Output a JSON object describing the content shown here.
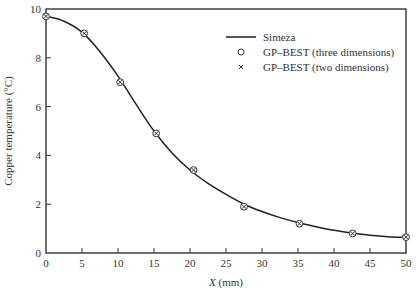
{
  "chart_data": {
    "type": "line",
    "title": "",
    "xlabel": "X (mm)",
    "xlabel_italic_part": "X",
    "xlabel_rest": " (mm)",
    "ylabel": "Copper temperature (°C)",
    "xlim": [
      0,
      50
    ],
    "ylim": [
      0,
      10
    ],
    "xticks": [
      0,
      5,
      10,
      15,
      20,
      25,
      30,
      35,
      40,
      45,
      50
    ],
    "yticks": [
      0,
      2,
      4,
      6,
      8,
      10
    ],
    "grid": false,
    "legend_position": "upper right",
    "series": [
      {
        "name": "Simeza",
        "style": "solid-line",
        "color": "#222222",
        "x": [
          0,
          2.5,
          5,
          7.5,
          10,
          12.5,
          15,
          17.5,
          20,
          22.5,
          25,
          27.5,
          30,
          32.5,
          35,
          37.5,
          40,
          42.5,
          45,
          47.5,
          50
        ],
        "y": [
          9.7,
          9.5,
          9.05,
          8.25,
          7.25,
          6.1,
          5.0,
          4.1,
          3.4,
          2.85,
          2.4,
          2.0,
          1.7,
          1.45,
          1.25,
          1.08,
          0.93,
          0.82,
          0.73,
          0.67,
          0.64
        ]
      },
      {
        "name": "GP–BEST (three dimensions)",
        "style": "open-circle-marker",
        "color": "#333333",
        "x": [
          0,
          5.3,
          10.3,
          15.3,
          20.5,
          27.5,
          35.2,
          42.6,
          50
        ],
        "y": [
          9.7,
          9.0,
          7.0,
          4.9,
          3.4,
          1.9,
          1.2,
          0.8,
          0.65
        ]
      },
      {
        "name": "GP–BEST (two dimensions)",
        "style": "x-marker",
        "color": "#333333",
        "x": [
          0,
          5.3,
          10.3,
          15.3,
          20.5,
          27.5,
          35.2,
          42.6,
          50
        ],
        "y": [
          9.7,
          9.0,
          7.0,
          4.9,
          3.4,
          1.9,
          1.2,
          0.8,
          0.65
        ]
      }
    ]
  },
  "legend": {
    "items": [
      {
        "label": "Simeza",
        "symbol": "line"
      },
      {
        "label": "GP–BEST (three dimensions)",
        "symbol": "circle"
      },
      {
        "label": "GP–BEST (two dimensions)",
        "symbol": "cross"
      }
    ]
  }
}
